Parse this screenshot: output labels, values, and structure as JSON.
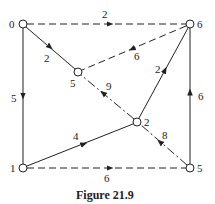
{
  "caption": "Figure 21.9",
  "nodes": [
    {
      "id": "n0",
      "label": "0",
      "x": 23,
      "y": 24,
      "lx": 9,
      "ly": 28
    },
    {
      "id": "n6",
      "label": "6",
      "x": 190,
      "y": 24,
      "lx": 197,
      "ly": 28
    },
    {
      "id": "n5m",
      "label": "5",
      "x": 78,
      "y": 72,
      "lx": 70,
      "ly": 87
    },
    {
      "id": "n2",
      "label": "2",
      "x": 137,
      "y": 122,
      "lx": 144,
      "ly": 126
    },
    {
      "id": "n1",
      "label": "1",
      "x": 23,
      "y": 168,
      "lx": 10,
      "ly": 172
    },
    {
      "id": "n5b",
      "label": "5",
      "x": 190,
      "y": 168,
      "lx": 197,
      "ly": 172
    }
  ],
  "edges": [
    {
      "from": "0",
      "to": "6",
      "weight": "2",
      "style": "dashed"
    },
    {
      "from": "0",
      "to": "5",
      "weight": "2",
      "style": "solid"
    },
    {
      "from": "0",
      "to": "1",
      "weight": "5",
      "style": "solid"
    },
    {
      "from": "6",
      "to": "5",
      "weight": "6",
      "style": "dashed"
    },
    {
      "from": "2",
      "to": "6",
      "weight": "2",
      "style": "solid"
    },
    {
      "from": "2",
      "to": "5",
      "weight": "9",
      "style": "dashdot"
    },
    {
      "from": "1",
      "to": "2",
      "weight": "4",
      "style": "solid"
    },
    {
      "from": "1",
      "to": "5",
      "weight": "6",
      "style": "dashed"
    },
    {
      "from": "5",
      "to": "6",
      "weight": "6",
      "style": "solid"
    },
    {
      "from": "5",
      "to": "2",
      "weight": "8",
      "style": "dashdot"
    }
  ]
}
